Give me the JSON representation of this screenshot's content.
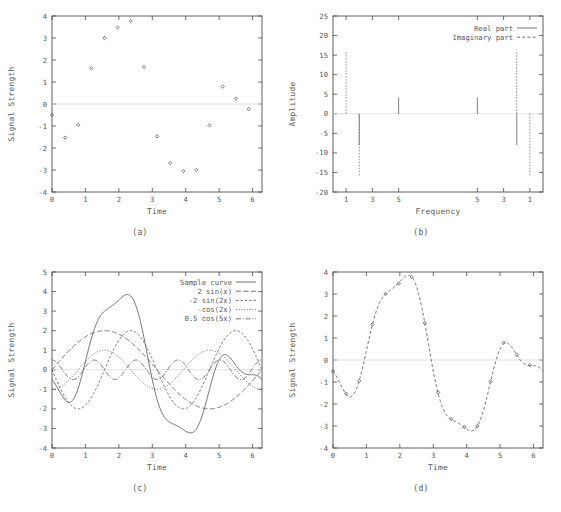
{
  "figure": {
    "background": "#ffffff",
    "ink": "#55585a"
  },
  "panels": [
    {
      "id": "a",
      "caption": "(a)",
      "xlabel": "Time",
      "ylabel": "Signal Strength"
    },
    {
      "id": "b",
      "caption": "(b)",
      "xlabel": "Frequency",
      "ylabel": "Amplitude"
    },
    {
      "id": "c",
      "caption": "(c)",
      "xlabel": "Time",
      "ylabel": "Signal Strength"
    },
    {
      "id": "d",
      "caption": "(d)",
      "xlabel": "Time",
      "ylabel": "Signal Strength"
    }
  ],
  "chart_data": [
    {
      "type": "scatter",
      "panel": "a",
      "title": "",
      "xlabel": "Time",
      "ylabel": "Signal Strength",
      "xlim": [
        0,
        6.2832
      ],
      "ylim": [
        -4,
        4
      ],
      "xticks": [
        0,
        1,
        2,
        3,
        4,
        5,
        6
      ],
      "yticks": [
        -4,
        -3,
        -2,
        -1,
        0,
        1,
        2,
        3,
        4
      ],
      "grid": false,
      "legend": "none",
      "marker": "point",
      "x": [
        0.0,
        0.3927,
        0.7854,
        1.1781,
        1.5708,
        1.9635,
        2.3562,
        2.7489,
        3.1416,
        3.5343,
        3.927,
        4.3197,
        4.7124,
        5.1051,
        5.4978,
        5.8905
      ],
      "y": [
        -0.5,
        -1.53,
        -0.95,
        1.62,
        3.0,
        3.48,
        3.77,
        1.68,
        -1.47,
        -2.68,
        -3.05,
        -3.0,
        -0.97,
        0.79,
        0.25,
        -0.23
      ]
    },
    {
      "type": "bar",
      "panel": "b",
      "title": "",
      "xlabel": "Frequency",
      "ylabel": "Amplitude",
      "xlim": [
        0,
        16
      ],
      "ylim": [
        -20,
        25
      ],
      "xticks": [
        1,
        3,
        5,
        11,
        13,
        15
      ],
      "xticklabels": [
        "1",
        "3",
        "5",
        "5",
        "3",
        "1"
      ],
      "yticks": [
        -20,
        -15,
        -10,
        -5,
        0,
        5,
        10,
        15,
        20,
        25
      ],
      "grid": false,
      "legend": "upper right",
      "series": [
        {
          "name": "Real part",
          "style": "solid",
          "x": [
            1,
            2,
            3,
            4,
            5,
            6,
            7,
            8,
            9,
            10,
            11,
            12,
            13,
            14,
            15
          ],
          "values": [
            0,
            -8.0,
            0,
            0,
            4.2,
            0,
            0,
            0,
            0,
            0,
            4.2,
            0,
            0,
            -8.0,
            0
          ]
        },
        {
          "name": "Imaginary part",
          "style": "dashed",
          "x": [
            1,
            2,
            3,
            4,
            5,
            6,
            7,
            8,
            9,
            10,
            11,
            12,
            13,
            14,
            15
          ],
          "values": [
            16.0,
            -16.0,
            0,
            0,
            0,
            0,
            0,
            0,
            0,
            0,
            0,
            0,
            0,
            16.0,
            -16.0
          ]
        }
      ]
    },
    {
      "type": "line",
      "panel": "c",
      "title": "",
      "xlabel": "Time",
      "ylabel": "Signal Strength",
      "xlim": [
        0,
        6.2832
      ],
      "ylim": [
        -4,
        5
      ],
      "xticks": [
        0,
        1,
        2,
        3,
        4,
        5,
        6
      ],
      "yticks": [
        -4,
        -3,
        -2,
        -1,
        0,
        1,
        2,
        3,
        4,
        5
      ],
      "grid": false,
      "legend": "upper right",
      "series": [
        {
          "name": "Sample curve",
          "style": "solid",
          "formula": "2*sin(x) - 2*sin(2x) - cos(2x) + 0.5*cos(5x)"
        },
        {
          "name": "2 sin(x)",
          "style": "dashed-long",
          "formula": "2*sin(x)"
        },
        {
          "name": "-2 sin(2x)",
          "style": "dashed-short",
          "formula": "-2*sin(2*x)"
        },
        {
          "name": "-cos(2x)",
          "style": "dotted",
          "formula": "-cos(2*x)"
        },
        {
          "name": "0.5 cos(5x)",
          "style": "dash-dot",
          "formula": "0.5*cos(5*x)"
        }
      ]
    },
    {
      "type": "line",
      "panel": "d",
      "title": "",
      "xlabel": "Time",
      "ylabel": "Signal Strength",
      "xlim": [
        0,
        6.2832
      ],
      "ylim": [
        -4,
        4
      ],
      "xticks": [
        0,
        1,
        2,
        3,
        4,
        5,
        6
      ],
      "yticks": [
        -4,
        -3,
        -2,
        -1,
        0,
        1,
        2,
        3,
        4
      ],
      "grid": false,
      "legend": "none",
      "fit_style": "dashed",
      "formula": "2*sin(x) - 2*sin(2x) - cos(2x) + 0.5*cos(5x)",
      "x": [
        0.0,
        0.3927,
        0.7854,
        1.1781,
        1.5708,
        1.9635,
        2.3562,
        2.7489,
        3.1416,
        3.5343,
        3.927,
        4.3197,
        4.7124,
        5.1051,
        5.4978,
        5.8905
      ],
      "y": [
        -0.5,
        -1.53,
        -0.95,
        1.62,
        3.0,
        3.48,
        3.77,
        1.68,
        -1.47,
        -2.68,
        -3.05,
        -3.0,
        -0.97,
        0.79,
        0.25,
        -0.23
      ]
    }
  ]
}
